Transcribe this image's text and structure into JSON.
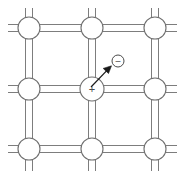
{
  "figure": {
    "width": 184,
    "height": 179,
    "background_color": "#ffffff",
    "line_color": "#7d7d7d",
    "ion_stroke_color": "#6e6e6e",
    "ion_fill_color": "#ffffff",
    "symbol_color": "#4a4a4a",
    "arrow_color": "#1a1a1a"
  },
  "lattice": {
    "description": "3x3 array of lattice-site ions connected by double-line bonds",
    "columns_x": [
      29,
      92,
      155
    ],
    "rows_y": [
      28,
      89,
      149
    ],
    "ion_radius": 11,
    "bond_offset": 3.5,
    "stub_length": 11,
    "ions": [
      {
        "id": "ion-r1c1",
        "label": "",
        "cx": 29,
        "cy": 28,
        "r": 11
      },
      {
        "id": "ion-r1c2",
        "label": "",
        "cx": 92,
        "cy": 28,
        "r": 11
      },
      {
        "id": "ion-r1c3",
        "label": "",
        "cx": 155,
        "cy": 28,
        "r": 11
      },
      {
        "id": "ion-r2c1",
        "label": "",
        "cx": 29,
        "cy": 89,
        "r": 11
      },
      {
        "id": "ion-r2c2",
        "label": "+",
        "cx": 92,
        "cy": 89,
        "r": 12
      },
      {
        "id": "ion-r2c3",
        "label": "",
        "cx": 155,
        "cy": 89,
        "r": 11
      },
      {
        "id": "ion-r3c1",
        "label": "",
        "cx": 29,
        "cy": 149,
        "r": 11
      },
      {
        "id": "ion-r3c2",
        "label": "",
        "cx": 92,
        "cy": 149,
        "r": 11
      },
      {
        "id": "ion-r3c3",
        "label": "",
        "cx": 155,
        "cy": 149,
        "r": 11
      }
    ]
  },
  "annotations": {
    "cation": {
      "name": "positive-ion",
      "symbol": "+",
      "cx": 92,
      "cy": 89,
      "r": 12
    },
    "anion": {
      "name": "negative-ion",
      "symbol": "–",
      "cx": 118,
      "cy": 61,
      "r": 6
    },
    "arrow": {
      "name": "displacement-arrow",
      "x1": 91,
      "y1": 87,
      "x2": 110,
      "y2": 67,
      "head_length": 9,
      "head_width": 5
    }
  }
}
